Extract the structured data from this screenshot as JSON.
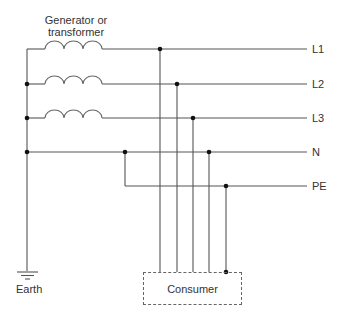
{
  "diagram": {
    "title": "Generator or transformer",
    "title_line1": "Generator or",
    "title_line2": "transformer",
    "conductors": [
      {
        "id": "L1",
        "label": "L1"
      },
      {
        "id": "L2",
        "label": "L2"
      },
      {
        "id": "L3",
        "label": "L3"
      },
      {
        "id": "N",
        "label": "N"
      },
      {
        "id": "PE",
        "label": "PE"
      }
    ],
    "earth_label": "Earth",
    "consumer_label": "Consumer",
    "colors": {
      "wire": "#555555",
      "junction": "#111111",
      "text": "#333333",
      "background": "#ffffff"
    }
  }
}
